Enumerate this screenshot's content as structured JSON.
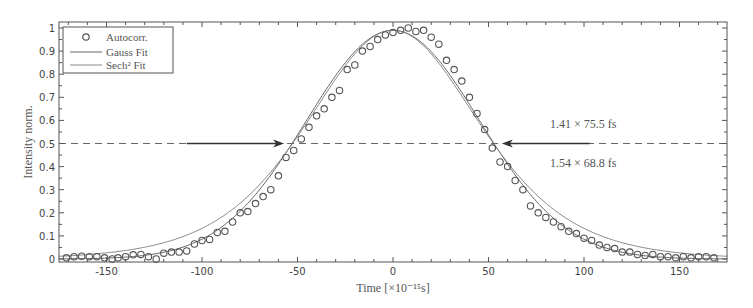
{
  "chart_data": {
    "type": "scatter",
    "title": "",
    "xlabel": "Time [×10⁻¹⁵s]",
    "ylabel": "Intensity norm.",
    "xlim": [
      -175,
      175
    ],
    "ylim": [
      0,
      1.02
    ],
    "x_ticks": [
      -150,
      -100,
      -50,
      0,
      50,
      100,
      150
    ],
    "y_ticks": [
      0,
      0.1,
      0.2,
      0.3,
      0.4,
      0.5,
      0.6,
      0.7,
      0.8,
      0.9,
      1
    ],
    "grid": false,
    "legend_position": "upper-left",
    "legend": [
      "Autocorr.",
      "Gauss Fit",
      "Sech² Fit"
    ],
    "annotations": [
      {
        "text": "1.41 × 75.5 fs",
        "x": 130,
        "y": 0.57
      },
      {
        "text": "1.54 × 68.8 fs",
        "x": 130,
        "y": 0.43
      }
    ],
    "half_max_line": 0.5,
    "arrows": [
      {
        "from_x": -108,
        "to_x": -57,
        "y": 0.5
      },
      {
        "from_x": 103,
        "to_x": 57,
        "y": 0.5
      }
    ],
    "series": [
      {
        "name": "Autocorr.",
        "style": "circle-markers",
        "x": [
          -171,
          -167,
          -163,
          -159,
          -155,
          -151,
          -147,
          -144,
          -140,
          -136,
          -132,
          -128,
          -124,
          -120,
          -116,
          -112,
          -108,
          -104,
          -100,
          -96,
          -92,
          -88,
          -84,
          -80,
          -76,
          -72,
          -68,
          -64,
          -60,
          -56,
          -52,
          -48,
          -44,
          -40,
          -36,
          -32,
          -28,
          -24,
          -20,
          -16,
          -12,
          -8,
          -4,
          0,
          4,
          8,
          12,
          16,
          20,
          24,
          28,
          32,
          36,
          40,
          44,
          48,
          52,
          56,
          60,
          64,
          68,
          72,
          76,
          80,
          84,
          88,
          92,
          96,
          100,
          104,
          108,
          112,
          116,
          120,
          124,
          128,
          132,
          136,
          140,
          144,
          148,
          152,
          156,
          160,
          164,
          168
        ],
        "y": [
          0.005,
          0.01,
          0.012,
          0.01,
          0.01,
          0.005,
          0.0,
          0.005,
          0.01,
          0.018,
          0.02,
          0.01,
          0.0,
          0.025,
          0.03,
          0.03,
          0.035,
          0.065,
          0.08,
          0.085,
          0.115,
          0.12,
          0.16,
          0.2,
          0.205,
          0.24,
          0.27,
          0.3,
          0.36,
          0.44,
          0.47,
          0.52,
          0.57,
          0.62,
          0.65,
          0.7,
          0.73,
          0.82,
          0.84,
          0.9,
          0.92,
          0.95,
          0.97,
          0.98,
          0.99,
          1.0,
          0.985,
          0.99,
          0.96,
          0.93,
          0.86,
          0.82,
          0.77,
          0.7,
          0.63,
          0.56,
          0.48,
          0.42,
          0.4,
          0.34,
          0.3,
          0.23,
          0.2,
          0.18,
          0.16,
          0.14,
          0.12,
          0.11,
          0.09,
          0.08,
          0.06,
          0.05,
          0.045,
          0.03,
          0.03,
          0.02,
          0.015,
          0.02,
          0.01,
          0.01,
          0.005,
          0.01,
          0.005,
          0.01,
          0.01,
          0.005
        ]
      },
      {
        "name": "Gauss Fit",
        "style": "line",
        "fwhm_fs": 106.5,
        "center": 0,
        "amplitude": 0.99
      },
      {
        "name": "Sech² Fit",
        "style": "line",
        "fwhm_fs": 106.0,
        "center": 0,
        "amplitude": 0.99
      }
    ]
  },
  "colors": {
    "axis": "#555555",
    "markers": "#555555",
    "gauss": "#666666",
    "sech": "#777777",
    "dashed": "#666666",
    "annotation": "#777777"
  }
}
